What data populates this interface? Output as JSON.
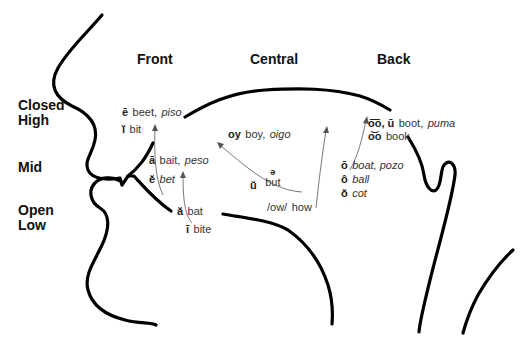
{
  "columns": {
    "front": "Front",
    "central": "Central",
    "back": "Back"
  },
  "rows": {
    "closed_high_1": "Closed",
    "closed_high_2": "High",
    "mid": "Mid",
    "open_low_1": "Open",
    "open_low_2": "Low"
  },
  "vowels": [
    {
      "symbol": "ē",
      "english": "beet,",
      "spanish": "piso"
    },
    {
      "symbol": "ĭ",
      "english": "bit",
      "spanish": ""
    },
    {
      "symbol": "ā",
      "english": "bait,",
      "spanish": "peso"
    },
    {
      "symbol": "ĕ",
      "english": "",
      "spanish": "bet"
    },
    {
      "symbol": "ă",
      "english": "bat",
      "spanish": ""
    },
    {
      "symbol": "ī",
      "english": "bite",
      "spanish": ""
    },
    {
      "symbol": "oy",
      "english": "boy,",
      "spanish": "oigo"
    },
    {
      "symbol": "ŭ",
      "english": "but",
      "spanish": "",
      "schwa": "ə"
    },
    {
      "symbol": "/ow/",
      "english": "how",
      "spanish": ""
    },
    {
      "symbol": "o͞o, ū",
      "english": "boot,",
      "spanish": "puma"
    },
    {
      "symbol": "o͝o",
      "english": "book",
      "spanish": ""
    },
    {
      "symbol": "ō",
      "english": "",
      "spanish": "boat, pozo"
    },
    {
      "symbol": "ô",
      "english": "",
      "spanish": "ball"
    },
    {
      "symbol": "ŏ",
      "english": "",
      "spanish": "cot"
    }
  ]
}
